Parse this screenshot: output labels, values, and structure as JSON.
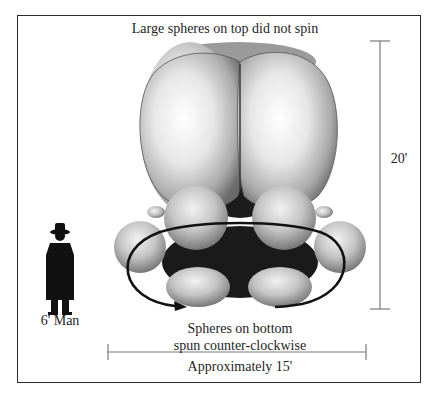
{
  "diagram": {
    "title": "Large spheres on top did not spin",
    "bottom_caption": {
      "line1": "Spheres on bottom",
      "line2": "spun counter-clockwise"
    },
    "width_dimension": "Approximately 15'",
    "height_dimension": "20'",
    "scale_figure_label": "6' Man",
    "object": {
      "top_spheres": 2,
      "bottom_spheres_visible": 6,
      "rotation": "counter-clockwise"
    },
    "colors": {
      "frame": "#2a2a2a",
      "scale_bar": "#777777",
      "arrow": "#111111",
      "silhouette": "#111111"
    }
  }
}
